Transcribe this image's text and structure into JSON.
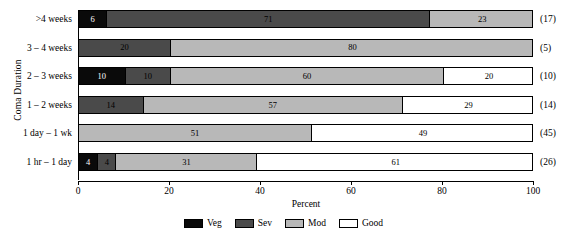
{
  "chart_data": {
    "type": "bar",
    "orientation": "horizontal",
    "stacked": true,
    "title": "",
    "xlabel": "Percent",
    "ylabel": "Coma Duration",
    "xlim": [
      0,
      100
    ],
    "xticks": [
      0,
      20,
      40,
      60,
      80,
      100
    ],
    "xtick_labels": [
      "0",
      "20",
      "40",
      "60",
      "80",
      "100"
    ],
    "grid": false,
    "legend_position": "bottom",
    "categories": [
      ">4 weeks",
      "3 – 4 weeks",
      "2 – 3 weeks",
      "1 – 2 weeks",
      "1 day – 1 wk",
      "1 hr – 1 day"
    ],
    "category_counts": [
      "(17)",
      "(5)",
      "(10)",
      "(14)",
      "(45)",
      "(26)"
    ],
    "series": [
      {
        "name": "Veg",
        "color": "#0a0a0a",
        "values": [
          6,
          0,
          10,
          0,
          0,
          4
        ]
      },
      {
        "name": "Sev",
        "color": "#4a4a4a",
        "values": [
          71,
          20,
          10,
          14,
          0,
          4
        ]
      },
      {
        "name": "Mod",
        "color": "#b8b8b8",
        "values": [
          23,
          80,
          60,
          57,
          51,
          31
        ]
      },
      {
        "name": "Good",
        "color": "#ffffff",
        "values": [
          0,
          0,
          20,
          29,
          49,
          61
        ]
      }
    ],
    "rows": [
      {
        "label": ">4 weeks",
        "count": "(17)",
        "segments": [
          {
            "series": "Veg",
            "value": 6,
            "label": "6"
          },
          {
            "series": "Sev",
            "value": 71,
            "label": "71"
          },
          {
            "series": "Mod",
            "value": 23,
            "label": "23"
          }
        ]
      },
      {
        "label": "3 – 4 weeks",
        "count": "(5)",
        "segments": [
          {
            "series": "Sev",
            "value": 20,
            "label": "20"
          },
          {
            "series": "Mod",
            "value": 80,
            "label": "80"
          }
        ]
      },
      {
        "label": "2 – 3 weeks",
        "count": "(10)",
        "segments": [
          {
            "series": "Veg",
            "value": 10,
            "label": "10"
          },
          {
            "series": "Sev",
            "value": 10,
            "label": "10"
          },
          {
            "series": "Mod",
            "value": 60,
            "label": "60"
          },
          {
            "series": "Good",
            "value": 20,
            "label": "20"
          }
        ]
      },
      {
        "label": "1 – 2 weeks",
        "count": "(14)",
        "segments": [
          {
            "series": "Sev",
            "value": 14,
            "label": "14"
          },
          {
            "series": "Mod",
            "value": 57,
            "label": "57"
          },
          {
            "series": "Good",
            "value": 29,
            "label": "29"
          }
        ]
      },
      {
        "label": "1 day – 1 wk",
        "count": "(45)",
        "segments": [
          {
            "series": "Mod",
            "value": 51,
            "label": "51"
          },
          {
            "series": "Good",
            "value": 49,
            "label": "49"
          }
        ]
      },
      {
        "label": "1 hr – 1 day",
        "count": "(26)",
        "segments": [
          {
            "series": "Veg",
            "value": 4,
            "label": "4"
          },
          {
            "series": "Sev",
            "value": 4,
            "label": "4"
          },
          {
            "series": "Mod",
            "value": 31,
            "label": "31"
          },
          {
            "series": "Good",
            "value": 61,
            "label": "61"
          }
        ]
      }
    ],
    "legend": [
      {
        "label": "Veg",
        "color": "#0a0a0a"
      },
      {
        "label": "Sev",
        "color": "#4a4a4a"
      },
      {
        "label": "Mod",
        "color": "#b8b8b8"
      },
      {
        "label": "Good",
        "color": "#ffffff"
      }
    ]
  }
}
